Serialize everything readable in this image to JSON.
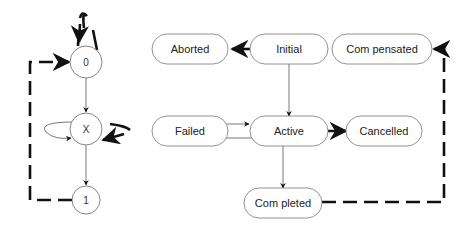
{
  "left_diagram": {
    "nodes": [
      {
        "id": "zero",
        "label": "0"
      },
      {
        "id": "x",
        "label": "X"
      },
      {
        "id": "one",
        "label": "1"
      }
    ],
    "edges": [
      {
        "from": "0",
        "to": "0",
        "style": "dashed-bold",
        "type": "self-loop"
      },
      {
        "from": "0",
        "to": "X",
        "style": "solid-thin"
      },
      {
        "from": "X",
        "to": "X",
        "style": "solid-thin",
        "type": "self-loop-left"
      },
      {
        "from": "X",
        "to": "X",
        "style": "dashed-bold",
        "type": "self-loop-right"
      },
      {
        "from": "X",
        "to": "1",
        "style": "solid-thin"
      },
      {
        "from": "1",
        "to": "0",
        "style": "dashed-bold"
      }
    ]
  },
  "right_diagram": {
    "nodes": [
      {
        "id": "aborted",
        "label": "Aborted"
      },
      {
        "id": "initial",
        "label": "Initial"
      },
      {
        "id": "compensated",
        "label": "Com pensated"
      },
      {
        "id": "failed",
        "label": "Failed"
      },
      {
        "id": "active",
        "label": "Active"
      },
      {
        "id": "cancelled",
        "label": "Cancelled"
      },
      {
        "id": "completed",
        "label": "Com pleted"
      }
    ],
    "edges": [
      {
        "from": "Initial",
        "to": "Aborted",
        "style": "dashed-bold"
      },
      {
        "from": "Initial",
        "to": "Active",
        "style": "solid-thin"
      },
      {
        "from": "Failed",
        "to": "Active",
        "style": "solid-thin"
      },
      {
        "from": "Active",
        "to": "Failed",
        "style": "solid-thin"
      },
      {
        "from": "Active",
        "to": "Cancelled",
        "style": "dashed-bold"
      },
      {
        "from": "Active",
        "to": "Completed",
        "style": "solid-thin"
      },
      {
        "from": "Completed",
        "to": "Compensated",
        "style": "dashed-bold"
      }
    ]
  },
  "colors": {
    "stroke": "#555555",
    "bold_stroke": "#111111",
    "background": "#ffffff"
  }
}
